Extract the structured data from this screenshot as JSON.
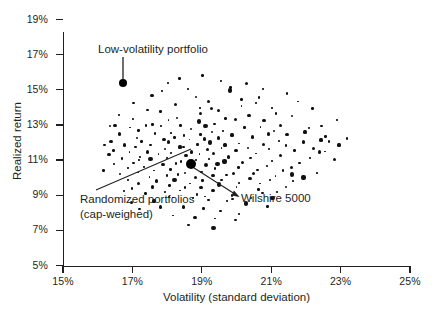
{
  "chart_data": {
    "type": "scatter",
    "title": "",
    "xlabel": "Volatility (standard deviation)",
    "ylabel": "Realized return",
    "xlim": [
      15,
      25
    ],
    "ylim": [
      5,
      19
    ],
    "xticks": [
      "15%",
      "17%",
      "19%",
      "21%",
      "23%",
      "25%"
    ],
    "xtick_values": [
      15,
      17,
      19,
      21,
      23,
      25
    ],
    "yticks": [
      "5%",
      "7%",
      "9%",
      "11%",
      "13%",
      "15%",
      "17%",
      "19%"
    ],
    "ytick_values": [
      5,
      7,
      9,
      11,
      13,
      15,
      17,
      19
    ],
    "grid": false,
    "legend": null,
    "annotations": [
      {
        "name": "low-volatility-portfolio",
        "text": "Low-volatility portfolio",
        "point": [
          16.7,
          15.6
        ]
      },
      {
        "name": "randomized-portfolios",
        "text": "Randomized portfolios\n(cap-weighed)",
        "point": [
          18.4,
          11.4
        ]
      },
      {
        "name": "wilshire-5000",
        "text": "Wilshire 5000",
        "point": [
          18.7,
          10.9
        ]
      }
    ],
    "series": [
      {
        "name": "Randomized portfolios (cap-weighed)",
        "marker": "square-dot",
        "color": "#111010",
        "points": [
          [
            17.9,
            14.9
          ],
          [
            18.6,
            15.0
          ],
          [
            19.8,
            15.1
          ],
          [
            20.6,
            14.6
          ],
          [
            19.2,
            14.4
          ],
          [
            18.2,
            14.2
          ],
          [
            20.1,
            14.1
          ],
          [
            21.0,
            14.0
          ],
          [
            17.4,
            13.9
          ],
          [
            19.5,
            13.8
          ],
          [
            18.8,
            14.6
          ],
          [
            20.4,
            13.6
          ],
          [
            21.6,
            13.5
          ],
          [
            17.0,
            13.4
          ],
          [
            18.0,
            13.3
          ],
          [
            19.0,
            13.6
          ],
          [
            19.7,
            13.4
          ],
          [
            20.8,
            13.2
          ],
          [
            21.3,
            13.0
          ],
          [
            16.9,
            12.9
          ],
          [
            17.6,
            13.1
          ],
          [
            18.3,
            13.4
          ],
          [
            18.9,
            13.2
          ],
          [
            19.4,
            13.1
          ],
          [
            20.0,
            13.3
          ],
          [
            20.7,
            12.9
          ],
          [
            21.1,
            12.7
          ],
          [
            22.0,
            12.6
          ],
          [
            16.6,
            12.5
          ],
          [
            17.2,
            12.7
          ],
          [
            17.8,
            12.9
          ],
          [
            18.4,
            13.0
          ],
          [
            18.7,
            12.8
          ],
          [
            19.1,
            12.9
          ],
          [
            19.6,
            12.7
          ],
          [
            20.2,
            12.8
          ],
          [
            20.9,
            12.5
          ],
          [
            21.5,
            12.4
          ],
          [
            22.4,
            12.2
          ],
          [
            16.4,
            12.1
          ],
          [
            17.1,
            12.3
          ],
          [
            17.7,
            12.5
          ],
          [
            18.1,
            12.6
          ],
          [
            18.5,
            12.4
          ],
          [
            18.95,
            12.5
          ],
          [
            19.3,
            12.6
          ],
          [
            19.9,
            12.4
          ],
          [
            20.5,
            12.3
          ],
          [
            21.2,
            12.1
          ],
          [
            21.9,
            12.0
          ],
          [
            16.8,
            11.9
          ],
          [
            17.3,
            12.0
          ],
          [
            17.9,
            12.2
          ],
          [
            18.25,
            12.3
          ],
          [
            18.6,
            12.1
          ],
          [
            19.05,
            12.2
          ],
          [
            19.45,
            12.3
          ],
          [
            20.1,
            12.0
          ],
          [
            20.75,
            11.9
          ],
          [
            21.4,
            11.8
          ],
          [
            22.2,
            11.7
          ],
          [
            16.5,
            11.6
          ],
          [
            17.05,
            11.7
          ],
          [
            17.55,
            11.9
          ],
          [
            18.05,
            12.0
          ],
          [
            18.45,
            11.8
          ],
          [
            18.85,
            11.9
          ],
          [
            19.25,
            12.0
          ],
          [
            19.7,
            11.8
          ],
          [
            20.3,
            11.7
          ],
          [
            20.95,
            11.6
          ],
          [
            21.7,
            11.5
          ],
          [
            16.3,
            11.3
          ],
          [
            16.95,
            11.4
          ],
          [
            17.45,
            11.5
          ],
          [
            17.95,
            11.6
          ],
          [
            18.35,
            11.7
          ],
          [
            18.75,
            11.5
          ],
          [
            19.15,
            11.6
          ],
          [
            19.55,
            11.7
          ],
          [
            20.0,
            11.5
          ],
          [
            20.6,
            11.4
          ],
          [
            21.25,
            11.3
          ],
          [
            22.1,
            11.2
          ],
          [
            16.7,
            11.1
          ],
          [
            17.25,
            11.2
          ],
          [
            17.75,
            11.3
          ],
          [
            18.15,
            11.4
          ],
          [
            18.55,
            11.2
          ],
          [
            18.9,
            11.3
          ],
          [
            19.35,
            11.4
          ],
          [
            19.8,
            11.2
          ],
          [
            20.4,
            11.1
          ],
          [
            21.0,
            11.0
          ],
          [
            21.8,
            10.9
          ],
          [
            16.45,
            10.8
          ],
          [
            17.0,
            10.9
          ],
          [
            17.5,
            11.0
          ],
          [
            18.0,
            11.1
          ],
          [
            18.4,
            10.9
          ],
          [
            18.8,
            11.0
          ],
          [
            19.2,
            11.1
          ],
          [
            19.65,
            10.9
          ],
          [
            20.2,
            10.8
          ],
          [
            20.85,
            10.7
          ],
          [
            21.55,
            10.6
          ],
          [
            16.85,
            10.5
          ],
          [
            17.35,
            10.6
          ],
          [
            17.85,
            10.7
          ],
          [
            18.3,
            10.8
          ],
          [
            18.7,
            10.6
          ],
          [
            19.1,
            10.7
          ],
          [
            19.5,
            10.8
          ],
          [
            20.05,
            10.6
          ],
          [
            20.65,
            10.5
          ],
          [
            21.35,
            10.4
          ],
          [
            22.3,
            10.3
          ],
          [
            16.6,
            10.2
          ],
          [
            17.15,
            10.3
          ],
          [
            17.65,
            10.4
          ],
          [
            18.1,
            10.5
          ],
          [
            18.5,
            10.3
          ],
          [
            18.95,
            10.4
          ],
          [
            19.4,
            10.5
          ],
          [
            19.9,
            10.3
          ],
          [
            20.5,
            10.2
          ],
          [
            21.1,
            10.1
          ],
          [
            21.95,
            10.0
          ],
          [
            16.9,
            9.9
          ],
          [
            17.45,
            10.0
          ],
          [
            17.95,
            10.1
          ],
          [
            18.35,
            10.2
          ],
          [
            18.8,
            10.0
          ],
          [
            19.3,
            10.1
          ],
          [
            19.75,
            10.2
          ],
          [
            20.35,
            10.0
          ],
          [
            20.95,
            9.9
          ],
          [
            21.6,
            9.8
          ],
          [
            17.2,
            9.7
          ],
          [
            17.7,
            9.8
          ],
          [
            18.2,
            9.9
          ],
          [
            18.65,
            9.7
          ],
          [
            19.05,
            9.8
          ],
          [
            19.55,
            9.9
          ],
          [
            20.1,
            9.7
          ],
          [
            20.7,
            9.6
          ],
          [
            21.4,
            9.5
          ],
          [
            17.0,
            9.4
          ],
          [
            17.55,
            9.5
          ],
          [
            18.05,
            9.6
          ],
          [
            18.55,
            9.4
          ],
          [
            19.0,
            9.5
          ],
          [
            19.45,
            9.6
          ],
          [
            20.0,
            9.4
          ],
          [
            20.6,
            9.3
          ],
          [
            21.2,
            9.2
          ],
          [
            17.35,
            9.1
          ],
          [
            17.9,
            9.2
          ],
          [
            18.4,
            9.3
          ],
          [
            18.9,
            9.1
          ],
          [
            19.35,
            9.2
          ],
          [
            19.85,
            9.0
          ],
          [
            20.45,
            8.9
          ],
          [
            21.05,
            8.8
          ],
          [
            17.6,
            8.7
          ],
          [
            18.15,
            8.8
          ],
          [
            18.7,
            8.9
          ],
          [
            19.2,
            8.7
          ],
          [
            19.7,
            8.6
          ],
          [
            20.25,
            8.5
          ],
          [
            20.9,
            8.4
          ],
          [
            17.85,
            8.3
          ],
          [
            18.45,
            8.4
          ],
          [
            19.0,
            8.2
          ],
          [
            19.55,
            8.1
          ],
          [
            20.1,
            8.0
          ],
          [
            18.2,
            7.9
          ],
          [
            18.8,
            7.8
          ],
          [
            19.4,
            7.7
          ],
          [
            20.0,
            7.6
          ],
          [
            18.6,
            7.3
          ],
          [
            19.3,
            7.2
          ],
          [
            17.25,
            8.2
          ],
          [
            16.95,
            8.6
          ],
          [
            16.75,
            9.2
          ],
          [
            22.5,
            11.5
          ],
          [
            22.6,
            12.4
          ],
          [
            22.8,
            11.0
          ],
          [
            23.0,
            11.8
          ],
          [
            16.2,
            10.4
          ],
          [
            16.15,
            11.8
          ],
          [
            16.35,
            13.0
          ],
          [
            17.05,
            14.3
          ],
          [
            18.4,
            15.6
          ],
          [
            19.6,
            15.5
          ],
          [
            20.3,
            15.4
          ],
          [
            21.5,
            14.8
          ],
          [
            22.2,
            13.9
          ],
          [
            22.9,
            13.2
          ],
          [
            20.8,
            15.0
          ],
          [
            19.05,
            15.8
          ],
          [
            18.05,
            15.4
          ],
          [
            17.55,
            14.7
          ],
          [
            21.8,
            14.3
          ],
          [
            22.45,
            12.9
          ],
          [
            19.85,
            14.9
          ],
          [
            20.55,
            14.2
          ],
          [
            21.15,
            13.7
          ],
          [
            17.85,
            13.7
          ],
          [
            18.95,
            14.0
          ],
          [
            19.3,
            13.9
          ],
          [
            20.15,
            14.4
          ],
          [
            16.6,
            13.6
          ],
          [
            17.4,
            13.0
          ],
          [
            22.7,
            12.0
          ],
          [
            23.2,
            12.3
          ],
          [
            19.1,
            9.0
          ],
          [
            19.9,
            8.8
          ],
          [
            18.05,
            8.95
          ],
          [
            20.75,
            9.15
          ],
          [
            21.65,
            10.15
          ],
          [
            16.5,
            12.9
          ],
          [
            17.15,
            11.05
          ],
          [
            22.05,
            12.85
          ],
          [
            22.35,
            11.45
          ]
        ]
      }
    ]
  },
  "annotations_text": {
    "low_volatility": "Low-volatility portfolio",
    "randomized_line1": "Randomized portfolios",
    "randomized_line2": "(cap-weighed)",
    "wilshire": "Wilshire 5000"
  },
  "colors": {
    "ink": "#231f20",
    "marker": "#111010"
  }
}
